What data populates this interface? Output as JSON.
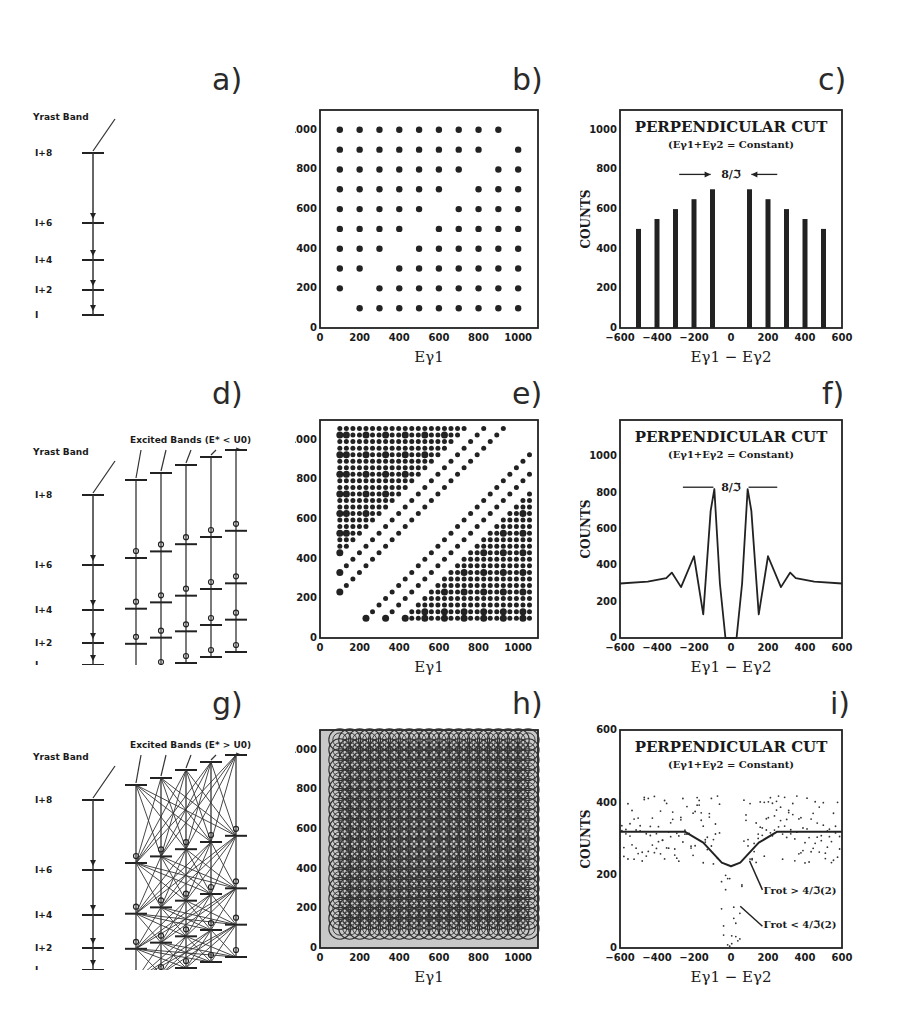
{
  "figure": {
    "panel_labels": [
      "a)",
      "b)",
      "c)",
      "d)",
      "e)",
      "f)",
      "g)",
      "h)",
      "i)"
    ],
    "level_scheme": {
      "yrast_label": "Yrast Band",
      "levels": [
        "I+8",
        "I+6",
        "I+4",
        "I+2",
        "I"
      ],
      "excited_label_d": "Excited Bands (E* < U0)",
      "excited_label_g": "Excited Bands (E* > U0)"
    },
    "matrix": {
      "xlabel": "Eγ1",
      "ylabel": "Eγ2",
      "ticks": [
        0,
        200,
        400,
        600,
        800,
        1000
      ]
    },
    "cut": {
      "title": "PERPENDICULAR CUT",
      "subtitle": "(Eγ1+Eγ2 = Constant)",
      "spacing_label": "8/ℑ",
      "xlabel": "Eγ1 − Eγ2",
      "ylabel": "COUNTS",
      "xticks": [
        -600,
        -400,
        -200,
        0,
        200,
        400,
        600
      ],
      "annot_gt": "Γrot > 4/ℑ(2)",
      "annot_lt": "Γrot < 4/ℑ(2)"
    }
  },
  "chart_data": [
    {
      "panel": "b",
      "type": "scatter",
      "title": "",
      "xlabel": "Eγ1",
      "ylabel": "Eγ2",
      "xlim": [
        0,
        1100
      ],
      "ylim": [
        0,
        1100
      ],
      "description": "Grid of points at multiples of 100 keV, excluding diagonal Eγ1 = Eγ2",
      "grid_step": 100,
      "x_range": [
        100,
        1000
      ],
      "y_range": [
        100,
        1000
      ]
    },
    {
      "panel": "c",
      "type": "bar",
      "title": "PERPENDICULAR CUT",
      "subtitle": "(Eγ1+Eγ2 = Constant)",
      "xlabel": "Eγ1 − Eγ2",
      "ylabel": "COUNTS",
      "categories": [
        -500,
        -400,
        -300,
        -200,
        -100,
        100,
        200,
        300,
        400,
        500
      ],
      "values": [
        500,
        550,
        600,
        650,
        700,
        700,
        650,
        600,
        550,
        500
      ],
      "xlim": [
        -600,
        600
      ],
      "ylim": [
        0,
        1100
      ],
      "yticks": [
        0,
        200,
        400,
        600,
        800,
        1000
      ]
    },
    {
      "panel": "e",
      "type": "scatter",
      "title": "",
      "xlabel": "Eγ1",
      "ylabel": "Eγ2",
      "xlim": [
        0,
        1100
      ],
      "ylim": [
        0,
        1100
      ],
      "description": "Ridge-valley structure: points along lines parallel to diagonal with a central valley"
    },
    {
      "panel": "f",
      "type": "line",
      "title": "PERPENDICULAR CUT",
      "subtitle": "(Eγ1+Eγ2 = Constant)",
      "xlabel": "Eγ1 − Eγ2",
      "ylabel": "COUNTS",
      "x": [
        -600,
        -450,
        -350,
        -320,
        -270,
        -200,
        -150,
        -110,
        -90,
        -60,
        -30,
        0,
        30,
        60,
        90,
        110,
        150,
        200,
        270,
        320,
        350,
        450,
        600
      ],
      "values": [
        300,
        310,
        330,
        360,
        280,
        450,
        130,
        700,
        820,
        300,
        0,
        0,
        0,
        300,
        820,
        700,
        130,
        450,
        280,
        360,
        330,
        310,
        300
      ],
      "xlim": [
        -600,
        600
      ],
      "ylim": [
        0,
        1200
      ],
      "yticks": [
        0,
        200,
        400,
        600,
        800,
        1000
      ]
    },
    {
      "panel": "h",
      "type": "scatter",
      "title": "",
      "xlabel": "Eγ1",
      "ylabel": "Eγ2",
      "xlim": [
        0,
        1100
      ],
      "ylim": [
        0,
        1100
      ],
      "description": "Dense overlapping circles covering matrix; damped rotational motion"
    },
    {
      "panel": "i",
      "type": "line",
      "title": "PERPENDICULAR CUT",
      "subtitle": "(Eγ1+Eγ2 = Constant)",
      "xlabel": "Eγ1 − Eγ2",
      "ylabel": "COUNTS",
      "series": [
        {
          "name": "Γrot > 4/ℑ(2)",
          "x": [
            -600,
            -250,
            -150,
            -50,
            0,
            50,
            150,
            250,
            600
          ],
          "values": [
            320,
            320,
            290,
            235,
            225,
            235,
            290,
            320,
            320
          ]
        },
        {
          "name": "Γrot < 4/ℑ(2)",
          "description": "scattered dots with dip to ~0 near 0"
        }
      ],
      "xlim": [
        -600,
        600
      ],
      "ylim": [
        0,
        600
      ],
      "yticks": [
        0,
        200,
        400,
        600
      ]
    }
  ]
}
